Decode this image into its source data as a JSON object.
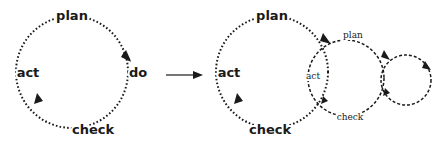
{
  "diagram": {
    "left_cycle": {
      "labels": {
        "top": "plan",
        "right": "do",
        "bottom": "check",
        "left": "act"
      }
    },
    "transition_arrow": {
      "direction": "right"
    },
    "right_cycles": {
      "large": {
        "labels": {
          "top": "plan",
          "bottom": "check",
          "left": "act"
        }
      },
      "medium": {
        "labels": {
          "top": "plan",
          "left": "act",
          "bottom": "check"
        }
      },
      "small": {
        "labels": {}
      }
    },
    "colors": {
      "stroke": "#1a1a1a",
      "background": "#ffffff"
    }
  }
}
